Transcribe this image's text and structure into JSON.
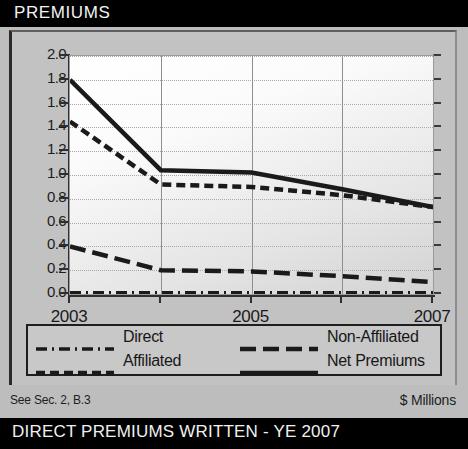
{
  "header": {
    "title": "PREMIUMS"
  },
  "footer": {
    "note": "See Sec. 2, B.3",
    "units": "$ Millions",
    "banner": "DIRECT PREMIUMS WRITTEN - YE 2007"
  },
  "colors": {
    "title_bar_bg": "#000000",
    "title_text": "#f2f2f2",
    "panel_bg": "#c2c2c2",
    "plot_bg": "#fbfbfb",
    "line": "#1a1a1a",
    "grid": "#a8a8a8",
    "axis": "#2f2f2f"
  },
  "chart_data": {
    "type": "line",
    "title": "PREMIUMS",
    "xlabel": "",
    "ylabel": "",
    "units": "$ Millions",
    "x": [
      2003,
      2004,
      2005,
      2006,
      2007
    ],
    "tick_labels_x": [
      "2003",
      "",
      "2005",
      "",
      "2007"
    ],
    "tick_labels_y": [
      "0.0",
      "0.2",
      "0.4",
      "0.6",
      "0.8",
      "1.0",
      "1.2",
      "1.4",
      "1.6",
      "1.8",
      "2.0"
    ],
    "ylim": [
      0.0,
      2.0
    ],
    "ytick_step": 0.2,
    "xlim": [
      2003,
      2007
    ],
    "grid": true,
    "legend_position": "below-plot",
    "series": [
      {
        "name": "Direct",
        "style": "dash-dot",
        "values": [
          0.01,
          0.01,
          0.01,
          0.01,
          0.01
        ]
      },
      {
        "name": "Affiliated",
        "style": "dashed",
        "values": [
          1.45,
          0.92,
          0.9,
          0.83,
          0.73
        ]
      },
      {
        "name": "Non-Affiliated",
        "style": "long-dash",
        "values": [
          0.4,
          0.2,
          0.19,
          0.15,
          0.1
        ]
      },
      {
        "name": "Net Premiums",
        "style": "solid",
        "values": [
          1.8,
          1.04,
          1.02,
          0.88,
          0.73
        ]
      }
    ]
  },
  "legend": {
    "items": [
      {
        "label": "Direct",
        "style": "dash-dot"
      },
      {
        "label": "Non-Affiliated",
        "style": "long-dash"
      },
      {
        "label": "Affiliated",
        "style": "dashed"
      },
      {
        "label": "Net Premiums",
        "style": "solid"
      }
    ]
  }
}
